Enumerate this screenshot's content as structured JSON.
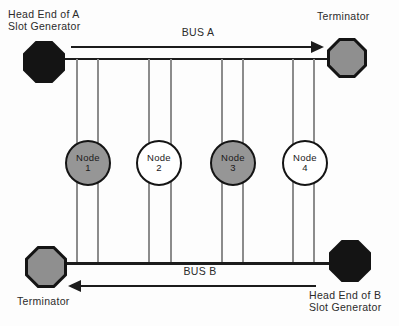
{
  "labels": {
    "head_end_a_line1": "Head End of A",
    "head_end_a_line2": "Slot Generator",
    "terminator_top": "Terminator",
    "bus_a": "BUS A",
    "bus_b": "BUS B",
    "terminator_bottom": "Terminator",
    "head_end_b_line1": "Head End of B",
    "head_end_b_line2": "Slot Generator"
  },
  "nodes": [
    {
      "name": "Node",
      "number": "1",
      "fill": "#969696"
    },
    {
      "name": "Node",
      "number": "2",
      "fill": "#ffffff"
    },
    {
      "name": "Node",
      "number": "3",
      "fill": "#969696"
    },
    {
      "name": "Node",
      "number": "4",
      "fill": "#ffffff"
    }
  ],
  "colors": {
    "octagon_black": "#141414",
    "octagon_gray": "#8f8f8f",
    "bus_line_black": "#1c1c1c",
    "tap_line_gray": "#8c8c8c",
    "background": "#fdfdfd",
    "text": "#2b2b2b"
  }
}
